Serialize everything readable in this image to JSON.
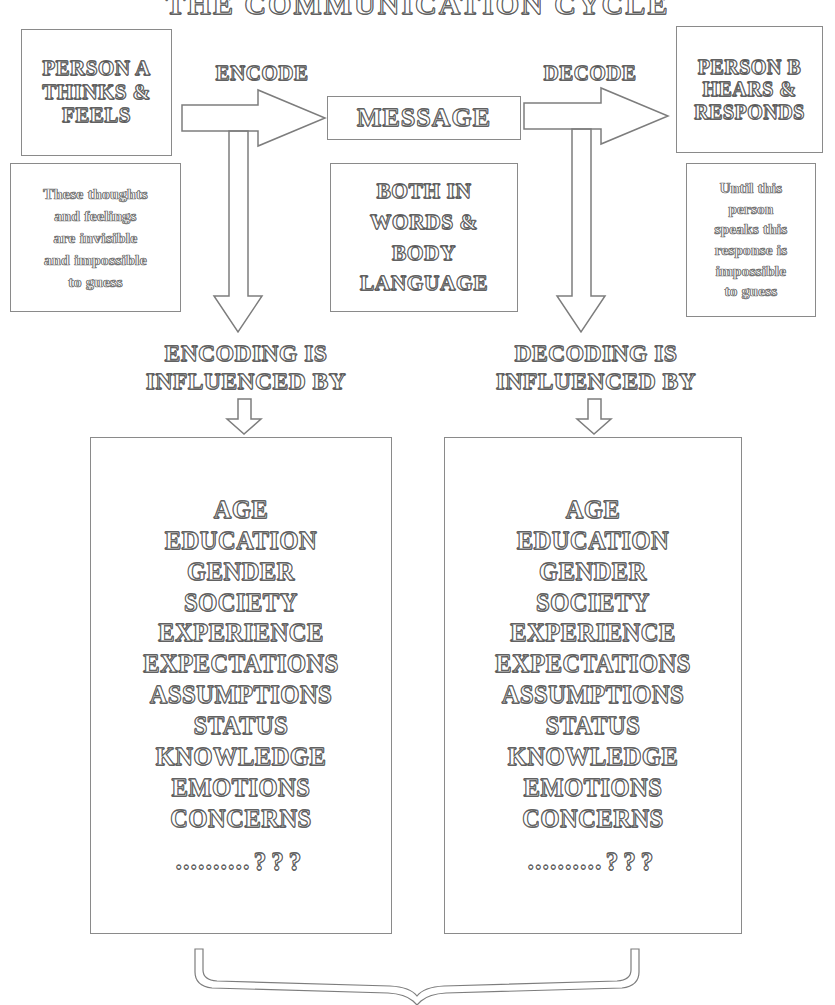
{
  "title": "THE COMMUNICATION CYCLE",
  "nodes": {
    "person_a": "PERSON A\nTHINKS &\nFEELS",
    "thoughts_note": "These thoughts\nand feelings\nare invisible\nand impossible\nto guess",
    "message": "MESSAGE",
    "message_note": "BOTH IN\nWORDS &\nBODY\nLANGUAGE",
    "person_b": "PERSON B\nHEARS &\nRESPONDS",
    "response_note": "Until this\nperson\nspeaks this\nresponse is\nimpossible\nto guess"
  },
  "arrows": {
    "encode_label": "ENCODE",
    "decode_label": "DECODE",
    "encoding_influenced_label": "ENCODING IS\nINFLUENCED BY",
    "decoding_influenced_label": "DECODING IS\nINFLUENCED BY"
  },
  "factors": {
    "left": [
      "AGE",
      "EDUCATION",
      "GENDER",
      "SOCIETY",
      "EXPERIENCE",
      "EXPECTATIONS",
      "ASSUMPTIONS",
      "STATUS",
      "KNOWLEDGE",
      "EMOTIONS",
      "CONCERNS"
    ],
    "right": [
      "AGE",
      "EDUCATION",
      "GENDER",
      "SOCIETY",
      "EXPERIENCE",
      "EXPECTATIONS",
      "ASSUMPTIONS",
      "STATUS",
      "KNOWLEDGE",
      "EMOTIONS",
      "CONCERNS"
    ],
    "trailing_dots": "..........",
    "trailing_question_marks": "???"
  },
  "colors": {
    "background": "#ffffff",
    "line": "#8a8a8a",
    "text_outline": "#6a6a6a"
  }
}
